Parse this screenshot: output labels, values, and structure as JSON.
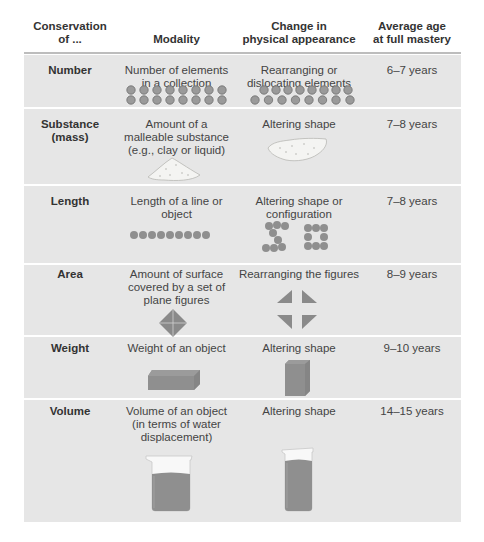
{
  "header": {
    "col1": "Conservation of ...",
    "col1_line1": "Conservation",
    "col1_line2": "of ...",
    "col2": "Modality",
    "col3_line1": "Change in",
    "col3_line2": "physical appearance",
    "col4_line1": "Average age",
    "col4_line2": "at full mastery"
  },
  "colors": {
    "row_bg": "#e6e6e6",
    "shape_gray": "#8c8c8c",
    "separator": "#ffffff"
  },
  "rows": [
    {
      "conservation": "Number",
      "modality_lines": [
        "Number of elements",
        "in a collection"
      ],
      "change_lines": [
        "Rearranging or",
        "dislocating elements"
      ],
      "age": "6–7 years",
      "modality_figure": "two-rows-of-8-hexagons",
      "change_figure": "two-rows-of-hexagons-spread"
    },
    {
      "conservation_lines": [
        "Substance",
        "(mass)"
      ],
      "modality_lines": [
        "Amount of a",
        "malleable substance",
        "(e.g., clay or liquid)"
      ],
      "change_lines": [
        "Altering shape"
      ],
      "age": "7–8 years",
      "modality_figure": "clay-mound",
      "change_figure": "flattened-clay"
    },
    {
      "conservation": "Length",
      "modality_lines": [
        "Length of a line or",
        "object"
      ],
      "change_lines": [
        "Altering shape or",
        "configuration"
      ],
      "age": "7–8 years",
      "modality_figure": "line-of-dots",
      "change_figure": "rearranged-dots"
    },
    {
      "conservation": "Area",
      "modality_lines": [
        "Amount of surface",
        "covered by a set of",
        "plane figures"
      ],
      "change_lines": [
        "Rearranging the figures"
      ],
      "age": "8–9 years",
      "modality_figure": "diamond-of-four-triangles",
      "change_figure": "four-separated-triangles"
    },
    {
      "conservation": "Weight",
      "modality_lines": [
        "Weight of an object"
      ],
      "change_lines": [
        "Altering shape"
      ],
      "age": "9–10 years",
      "modality_figure": "flat-block",
      "change_figure": "tall-block"
    },
    {
      "conservation": "Volume",
      "modality_lines": [
        "Volume of an object",
        "(in terms of water",
        "displacement)"
      ],
      "change_lines": [
        "Altering shape"
      ],
      "age": "14–15 years",
      "modality_figure": "wide-beaker",
      "change_figure": "narrow-beaker"
    }
  ]
}
